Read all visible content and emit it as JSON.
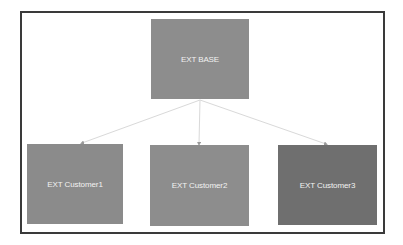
{
  "diagram": {
    "type": "hierarchy",
    "root": {
      "label": "EXT BASE",
      "color": "#8d8d8d"
    },
    "children": [
      {
        "label": "EXT Customer1",
        "color": "#8b8b8b"
      },
      {
        "label": "EXT Customer2",
        "color": "#8d8d8d"
      },
      {
        "label": "EXT Customer3",
        "color": "#6f6f6f"
      }
    ],
    "edges": [
      {
        "from": "EXT BASE",
        "to": "EXT Customer1"
      },
      {
        "from": "EXT BASE",
        "to": "EXT Customer2"
      },
      {
        "from": "EXT BASE",
        "to": "EXT Customer3"
      }
    ],
    "frame_border_color": "#3a3a3a",
    "edge_color": "#d9d9d9"
  }
}
